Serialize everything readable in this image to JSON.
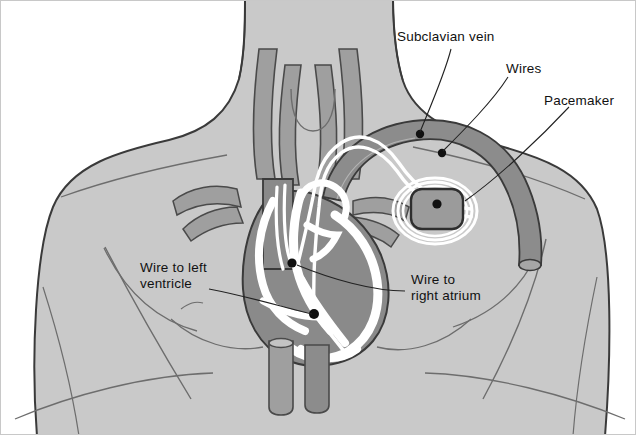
{
  "figure": {
    "background_color": "#ffffff",
    "border_color": "#c8c8c8",
    "body_fill": "#c9c9c9",
    "vessel_fill": "#9f9f9f",
    "vein_fill": "#8c8c8c",
    "heart_muscle_fill": "#8a8a8a",
    "chamber_fill": "#ffffff",
    "outline_color": "#3a3a3a",
    "electrode_color": "#111111",
    "wire_color": "#ffffff",
    "label_color": "#111111"
  },
  "labels": [
    {
      "id": "subclavian-vein",
      "text": "Subclavian vein",
      "x": 396,
      "y": 28
    },
    {
      "id": "wires",
      "text": "Wires",
      "x": 505,
      "y": 60
    },
    {
      "id": "pacemaker",
      "text": "Pacemaker",
      "x": 543,
      "y": 92
    },
    {
      "id": "wire-to-left-ventricle",
      "line1": "Wire to left",
      "line2": "ventricle",
      "x": 139,
      "y": 259
    },
    {
      "id": "wire-to-right-atrium",
      "line1": "Wire to",
      "line2": "right atrium",
      "x": 410,
      "y": 271
    }
  ],
  "electrodes": [
    {
      "id": "electrode-subclavian-upper",
      "cx": 419,
      "cy": 133,
      "r": 4.2
    },
    {
      "id": "electrode-subclavian-lower",
      "cx": 441,
      "cy": 152,
      "r": 4.2
    },
    {
      "id": "electrode-pacemaker-terminal",
      "cx": 436,
      "cy": 203,
      "r": 4.6
    },
    {
      "id": "electrode-right-atrium",
      "cx": 291,
      "cy": 262,
      "r": 4.6
    },
    {
      "id": "electrode-left-ventricle",
      "cx": 313,
      "cy": 313,
      "r": 5.0
    }
  ],
  "pacemaker_device": {
    "id": "pacemaker-device",
    "x": 410,
    "y": 188,
    "width": 52,
    "height": 40,
    "corner_radius": 11,
    "fill": "#9b9b9b"
  }
}
